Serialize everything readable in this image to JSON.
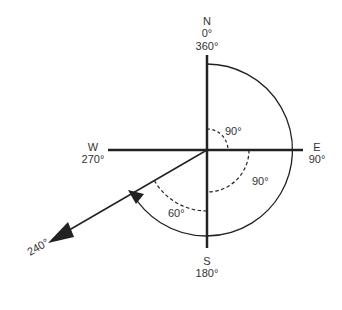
{
  "diagram": {
    "directions": {
      "north": {
        "letter": "N",
        "deg_a": "0°",
        "deg_b": "360°"
      },
      "east": {
        "letter": "E",
        "deg": "90°"
      },
      "south": {
        "letter": "S",
        "deg": "180°"
      },
      "west": {
        "letter": "W",
        "deg": "270°"
      }
    },
    "angles": {
      "first": "90°",
      "second": "90°",
      "third": "60°"
    },
    "bearing_label": "240°",
    "colors": {
      "stroke": "#222222",
      "text": "#333333",
      "background": "#ffffff"
    }
  }
}
